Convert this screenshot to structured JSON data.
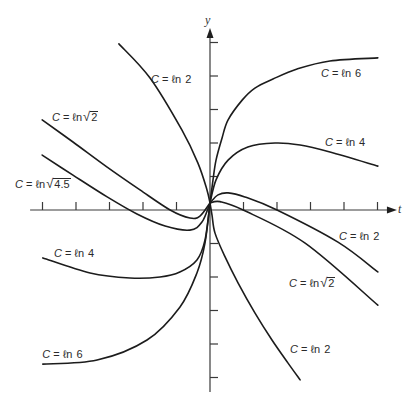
{
  "chart_data": {
    "type": "line",
    "title": "",
    "xlabel": "t",
    "ylabel": "y",
    "xlim": [
      -5.37,
      5.58
    ],
    "ylim": [
      -5.43,
      5.43
    ],
    "xticks": [
      -5,
      -4,
      -3,
      -2,
      -1,
      1,
      2,
      3,
      4,
      5
    ],
    "yticks": [
      -5,
      -4,
      -3,
      -2,
      -1,
      1,
      2,
      3,
      4,
      5
    ],
    "grid": false,
    "legend": "none (curves labeled inline)",
    "layout": {
      "origin_px": [
        210,
        210
      ],
      "unit_px": 33.5
    },
    "series": [
      {
        "name": "C = ln 6 (t > 0)",
        "points": [
          [
            0,
            0.21
          ],
          [
            0.09,
            0.9
          ],
          [
            0.18,
            1.49
          ],
          [
            0.36,
            2.15
          ],
          [
            0.54,
            2.69
          ],
          [
            0.96,
            3.28
          ],
          [
            1.34,
            3.64
          ],
          [
            1.88,
            3.91
          ],
          [
            2.6,
            4.21
          ],
          [
            3.58,
            4.45
          ],
          [
            5.01,
            4.54
          ]
        ]
      },
      {
        "name": "C = ln 4 (t > 0)",
        "points": [
          [
            0,
            0.21
          ],
          [
            0.18,
            0.9
          ],
          [
            0.54,
            1.49
          ],
          [
            1.13,
            1.88
          ],
          [
            1.94,
            2.0
          ],
          [
            2.69,
            1.94
          ],
          [
            3.58,
            1.73
          ],
          [
            5.01,
            1.31
          ]
        ]
      },
      {
        "name": "C = ln 2 (t > 0, upper)",
        "points": [
          [
            0,
            0.21
          ],
          [
            0.24,
            0.45
          ],
          [
            0.54,
            0.51
          ],
          [
            1.04,
            0.39
          ],
          [
            2.0,
            0.0
          ],
          [
            3.82,
            -0.96
          ],
          [
            5.01,
            -1.85
          ]
        ]
      },
      {
        "name": "C = ln sqrt(2) (t > 0)",
        "points": [
          [
            0,
            0.21
          ],
          [
            0.3,
            0.25
          ],
          [
            0.99,
            0.0
          ],
          [
            2.84,
            -0.99
          ],
          [
            5.01,
            -2.84
          ]
        ]
      },
      {
        "name": "C = ln 2 (t > 0, lower)",
        "points": [
          [
            0,
            0.21
          ],
          [
            0.06,
            -0.15
          ],
          [
            0.15,
            -0.69
          ],
          [
            0.45,
            -1.4
          ],
          [
            0.84,
            -2.18
          ],
          [
            1.34,
            -3.07
          ],
          [
            1.85,
            -3.88
          ],
          [
            2.33,
            -4.57
          ],
          [
            2.69,
            -5.07
          ]
        ]
      },
      {
        "name": "C = ln 2 (t < 0)",
        "points": [
          [
            -2.72,
            4.96
          ],
          [
            -1.79,
            3.94
          ],
          [
            -0.84,
            2.39
          ],
          [
            -0.36,
            1.4
          ],
          [
            -0.09,
            0.6
          ],
          [
            0,
            0.21
          ]
        ]
      },
      {
        "name": "C = ln sqrt(2) (t < 0)",
        "points": [
          [
            -5.01,
            2.69
          ],
          [
            -4.09,
            2.03
          ],
          [
            -3.07,
            1.28
          ],
          [
            -2.09,
            0.6
          ],
          [
            -1.19,
            0.0
          ],
          [
            -0.6,
            -0.24
          ],
          [
            -0.3,
            -0.18
          ],
          [
            0,
            0.21
          ]
        ]
      },
      {
        "name": "C = ln sqrt(4.5) (t < 0)",
        "points": [
          [
            -5.01,
            1.64
          ],
          [
            -4.09,
            1.04
          ],
          [
            -3.07,
            0.39
          ],
          [
            -2.18,
            -0.12
          ],
          [
            -1.34,
            -0.48
          ],
          [
            -0.6,
            -0.6
          ],
          [
            -0.24,
            -0.36
          ],
          [
            0,
            0.21
          ]
        ]
      },
      {
        "name": "C = ln 4 (t < 0)",
        "points": [
          [
            -4.99,
            -1.43
          ],
          [
            -3.58,
            -1.88
          ],
          [
            -2.39,
            -2.03
          ],
          [
            -1.49,
            -2.0
          ],
          [
            -0.9,
            -1.85
          ],
          [
            -0.39,
            -1.49
          ],
          [
            -0.15,
            -0.9
          ],
          [
            0,
            0.21
          ]
        ]
      },
      {
        "name": "C = ln 6 (t < 0)",
        "points": [
          [
            -4.99,
            -4.6
          ],
          [
            -3.37,
            -4.48
          ],
          [
            -1.88,
            -3.88
          ],
          [
            -0.9,
            -2.9
          ],
          [
            -0.39,
            -1.88
          ],
          [
            -0.15,
            -0.99
          ],
          [
            0,
            0.21
          ]
        ]
      }
    ],
    "annotations": [
      {
        "text": "C = ℓn 2",
        "var": "C",
        "eq": " = ℓn ",
        "root": "",
        "arg": "2",
        "t": -1.76,
        "y": 3.91
      },
      {
        "text": "C = ℓn 6",
        "var": "C",
        "eq": " = ℓn ",
        "root": "",
        "arg": "6",
        "t": 3.31,
        "y": 4.09
      },
      {
        "text": "C = ℓn 4",
        "var": "C",
        "eq": " = ℓn ",
        "root": "",
        "arg": "4",
        "t": 3.43,
        "y": 2.03
      },
      {
        "text": "C = ℓn √2",
        "var": "C",
        "eq": " = ℓn",
        "root": "√",
        "arg": "2",
        "t": -4.72,
        "y": 2.78
      },
      {
        "text": "C = ℓn √4.5",
        "var": "C",
        "eq": " = ℓn",
        "root": "√",
        "arg": "4.5",
        "t": -5.82,
        "y": 0.78
      },
      {
        "text": "C = ℓn 4",
        "var": "C",
        "eq": " = ℓn ",
        "root": "",
        "arg": "4",
        "t": -4.66,
        "y": -1.28
      },
      {
        "text": "C = ℓn 6",
        "var": "C",
        "eq": " = ℓn ",
        "root": "",
        "arg": "6",
        "t": -5.01,
        "y": -4.3
      },
      {
        "text": "C = ℓn 2",
        "var": "C",
        "eq": " = ℓn ",
        "root": "",
        "arg": "2",
        "t": 3.85,
        "y": -0.78
      },
      {
        "text": "C = ℓn √2",
        "var": "C",
        "eq": " = ℓn",
        "root": "√",
        "arg": "2",
        "t": 2.36,
        "y": -2.18
      },
      {
        "text": "C = ℓn 2",
        "var": "C",
        "eq": " = ℓn ",
        "root": "",
        "arg": "2",
        "t": 2.39,
        "y": -4.15
      }
    ]
  }
}
